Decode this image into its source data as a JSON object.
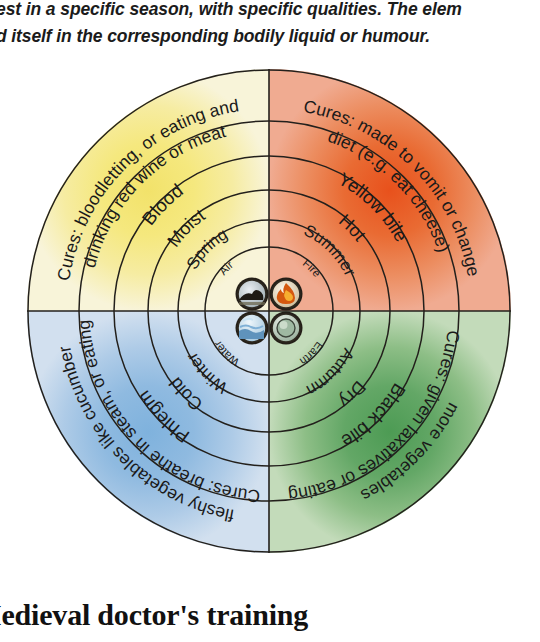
{
  "caption": {
    "line1": "est in a specific season, with specific qualities. The elem",
    "line2": "d itself in the corresponding bodily liquid or humour."
  },
  "heading": "Iedieval doctor's training",
  "diagram": {
    "center_elements": [
      {
        "name": "Air",
        "icon": "air-icon",
        "quadrant": "top-left",
        "color": "#efe06a"
      },
      {
        "name": "Fire",
        "icon": "fire-icon",
        "quadrant": "top-right",
        "color": "#e8561e"
      },
      {
        "name": "Water",
        "icon": "water-icon",
        "quadrant": "bottom-left",
        "color": "#7fb0dd"
      },
      {
        "name": "Earth",
        "icon": "earth-icon",
        "quadrant": "bottom-right",
        "color": "#4a8f4f"
      }
    ],
    "quadrants": [
      {
        "id": "sanguine",
        "position": "top-left",
        "element": "Air",
        "season": "Spring",
        "quality": "Moist",
        "humour": "Blood",
        "cure": "Cures: bloodletting, or eating and drinking red wine or meat",
        "cure_line1": "Cures: bloodletting, or eating and",
        "cure_line2": "drinking red wine or meat",
        "colors": {
          "inner": "#f3e679",
          "outer": "#f7f3d6"
        }
      },
      {
        "id": "choleric",
        "position": "top-right",
        "element": "Fire",
        "season": "Summer",
        "quality": "Hot",
        "humour": "Yellow bile",
        "cure": "Cures: made to vomit or change diet (e.g. eat cheese)",
        "cure_line1": "Cures: made to vomit or change",
        "cure_line2": "diet (e.g. eat cheese)",
        "colors": {
          "inner": "#e8561e",
          "outer": "#eea287"
        }
      },
      {
        "id": "phlegmatic",
        "position": "bottom-left",
        "element": "Water",
        "season": "Winter",
        "quality": "Cold",
        "humour": "Phlegm",
        "cure": "Cures: breathe in steam, or eating fleshy vegetables like cucumber",
        "cure_line1": "Cures: breathe in steam, or eating",
        "cure_line2": "fleshy vegetables like cucumber",
        "colors": {
          "inner": "#86b6de",
          "outer": "#ccdcef"
        }
      },
      {
        "id": "melancholic",
        "position": "bottom-right",
        "element": "Earth",
        "season": "Autumn",
        "quality": "Dry",
        "humour": "Black bile",
        "cure": "Cures: given laxatives or eating more vegetables",
        "cure_line1": "Cures: given laxatives or eating",
        "cure_line2": "more vegetables",
        "colors": {
          "inner": "#58a05c",
          "outer": "#bfd9b6"
        }
      }
    ],
    "ring_labels": {
      "r1": "element",
      "r2": "season",
      "r3": "quality",
      "r4": "humour",
      "r5": "cure"
    }
  }
}
